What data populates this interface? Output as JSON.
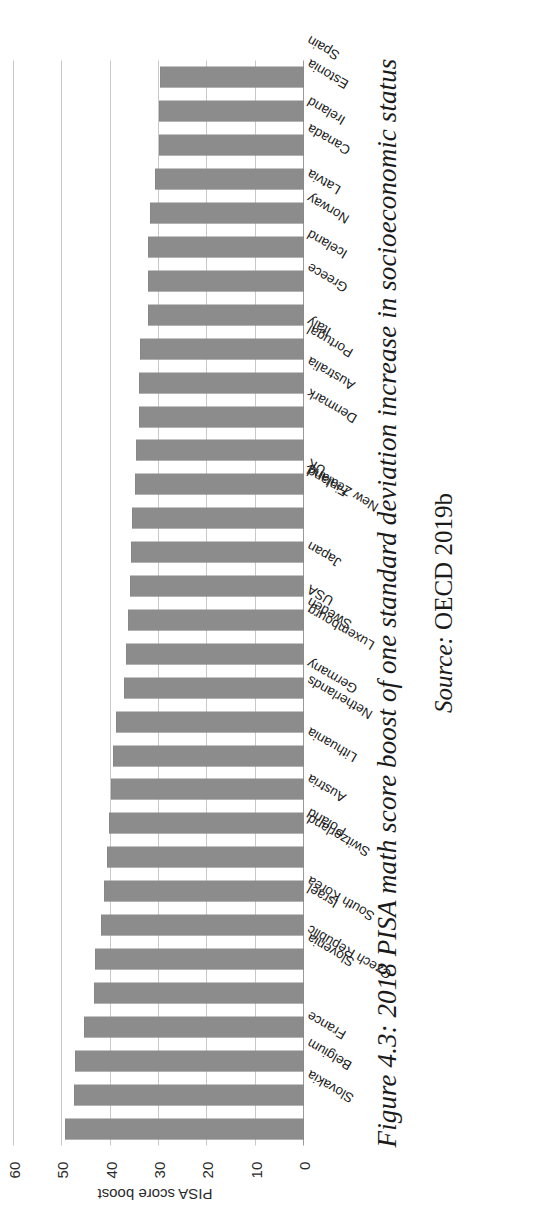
{
  "figure": {
    "caption": "Figure 4.3: 2018 PISA math score boost of one standard deviation increase in socioeconomic status",
    "source_label": "Source:",
    "source_value": "OECD 2019b"
  },
  "chart_data": {
    "type": "bar",
    "orientation": "vertical",
    "title": "",
    "xlabel": "",
    "ylabel": "PISA score boost",
    "ylim": [
      0,
      60
    ],
    "yticks": [
      0,
      10,
      20,
      30,
      40,
      50,
      60
    ],
    "grid": true,
    "legend": "none",
    "bar_color": "#8c8c8c",
    "gridline_color": "#c9c9c9",
    "categories": [
      "Slovakia",
      "Belgium",
      "France",
      "Czech Republic",
      "Slovenia",
      "South Korea",
      "Israel",
      "Switzerland",
      "Poland",
      "Austria",
      "Lithuania",
      "Netherlands",
      "Germany",
      "Luxembourg",
      "Sweden",
      "USA",
      "Japan",
      "New Zealand",
      "Finland",
      "UK",
      "Denmark",
      "Australia",
      "Portugal",
      "Italy",
      "Greece",
      "Iceland",
      "Norway",
      "Latvia",
      "Canada",
      "Ireland",
      "Estonia",
      "Spain"
    ],
    "values": [
      49.4,
      47.6,
      47.3,
      45.5,
      43.4,
      43.2,
      42.0,
      41.4,
      40.7,
      40.3,
      40.0,
      39.6,
      38.9,
      37.3,
      36.8,
      36.5,
      36.0,
      35.8,
      35.6,
      34.9,
      34.7,
      34.2,
      34.2,
      33.9,
      32.3,
      32.3,
      32.3,
      31.9,
      30.8,
      30.1,
      30.1,
      29.8
    ]
  }
}
